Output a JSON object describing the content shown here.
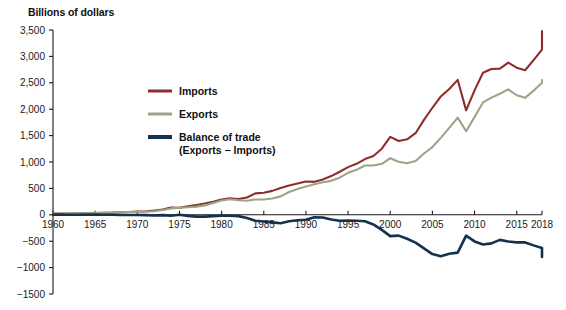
{
  "chart_data": {
    "type": "line",
    "title": "Billions of dollars",
    "xlabel": "",
    "ylabel": "Billions of dollars",
    "xlim": [
      1960,
      2018
    ],
    "ylim": [
      -1500,
      3500
    ],
    "ytick_values": [
      3500,
      3000,
      2500,
      2000,
      1500,
      1000,
      500,
      0,
      -500,
      -1000,
      -1500
    ],
    "ytick_labels": [
      "3,500",
      "3,000",
      "2,500",
      "2,000",
      "1,500",
      "1,000",
      "500",
      "0",
      "−500",
      "−1000",
      "−1500"
    ],
    "xtick_values": [
      1960,
      1965,
      1970,
      1975,
      1980,
      1985,
      1990,
      1995,
      2000,
      2005,
      2010,
      2015,
      2018
    ],
    "xtick_labels": [
      "1960",
      "1965",
      "1970",
      "1975",
      "1980",
      "1985",
      "1990",
      "1995",
      "2000",
      "2005",
      "2010",
      "2015",
      "2018"
    ],
    "grid": false,
    "legend_position": "inside-upper-left",
    "zero_line": true,
    "x": [
      1960,
      1961,
      1962,
      1963,
      1964,
      1965,
      1966,
      1967,
      1968,
      1969,
      1970,
      1971,
      1972,
      1973,
      1974,
      1975,
      1976,
      1977,
      1978,
      1979,
      1980,
      1981,
      1982,
      1983,
      1984,
      1985,
      1986,
      1987,
      1988,
      1989,
      1990,
      1991,
      1992,
      1993,
      1994,
      1995,
      1996,
      1997,
      1998,
      1999,
      2000,
      2001,
      2002,
      2003,
      2004,
      2005,
      2006,
      2007,
      2008,
      2009,
      2010,
      2011,
      2012,
      2013,
      2014,
      2015,
      2016,
      2017,
      2018
    ],
    "series": [
      {
        "name": "Imports",
        "color": "#8c2f2b",
        "width": 2.1,
        "values": [
          23,
          23,
          25,
          27,
          29,
          33,
          38,
          41,
          49,
          54,
          60,
          67,
          79,
          99,
          138,
          133,
          163,
          186,
          213,
          249,
          291,
          311,
          300,
          327,
          405,
          417,
          453,
          509,
          554,
          591,
          630,
          624,
          669,
          733,
          815,
          903,
          965,
          1056,
          1115,
          1252,
          1475,
          1399,
          1430,
          1545,
          1797,
          2027,
          2241,
          2383,
          2556,
          1978,
          2357,
          2690,
          2760,
          2768,
          2883,
          2786,
          2738,
          2930,
          3129
        ],
        "end_value": 3480
      },
      {
        "name": "Exports",
        "color": "#9ba587",
        "width": 2.1,
        "values": [
          26,
          26,
          27,
          29,
          34,
          36,
          39,
          42,
          46,
          50,
          57,
          60,
          67,
          92,
          121,
          133,
          143,
          152,
          178,
          224,
          272,
          294,
          275,
          266,
          291,
          289,
          310,
          349,
          431,
          487,
          536,
          578,
          617,
          643,
          703,
          795,
          852,
          934,
          933,
          966,
          1071,
          1005,
          977,
          1018,
          1161,
          1283,
          1457,
          1645,
          1840,
          1583,
          1853,
          2128,
          2219,
          2293,
          2376,
          2264,
          2215,
          2351,
          2500
        ],
        "end_value": 2550
      },
      {
        "name": "Balance of trade",
        "sublabel": "(Exports − Imports)",
        "color": "#15314b",
        "width": 2.6,
        "values": [
          3,
          3,
          2,
          2,
          5,
          3,
          1,
          1,
          -3,
          -4,
          -3,
          -7,
          -12,
          -7,
          -17,
          0,
          -20,
          -34,
          -35,
          -25,
          -19,
          -17,
          -25,
          -61,
          -114,
          -128,
          -143,
          -160,
          -123,
          -104,
          -94,
          -46,
          -52,
          -90,
          -112,
          -108,
          -113,
          -122,
          -182,
          -286,
          -404,
          -394,
          -453,
          -527,
          -636,
          -744,
          -784,
          -738,
          -716,
          -395,
          -504,
          -562,
          -541,
          -475,
          -507,
          -522,
          -523,
          -579,
          -629
        ],
        "end_value": -800
      }
    ],
    "legend": [
      {
        "label": "Imports",
        "color": "#8c2f2b",
        "swatch_width": 3
      },
      {
        "label": "Exports",
        "color": "#9ba587",
        "swatch_width": 3
      },
      {
        "label": "Balance of trade",
        "sublabel": "(Exports − Imports)",
        "color": "#15314b",
        "swatch_width": 4
      }
    ]
  },
  "colors": {
    "imports": "#8c2f2b",
    "exports": "#9ba587",
    "balance": "#15314b",
    "axis": "#1a1a1a",
    "background": "#ffffff"
  }
}
